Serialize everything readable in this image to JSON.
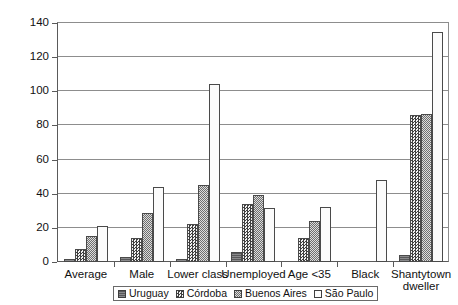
{
  "chart_data": {
    "type": "bar",
    "title": "",
    "xlabel": "",
    "ylabel": "",
    "ylim": [
      0,
      140
    ],
    "yticks": [
      0,
      20,
      40,
      60,
      80,
      100,
      120,
      140
    ],
    "grid": true,
    "legend_position": "bottom",
    "categories": [
      "Average",
      "Male",
      "Lower class",
      "Unemployed",
      "Age <35",
      "Black",
      "Shantytown dweller"
    ],
    "series": [
      {
        "name": "Uruguay",
        "pattern": "solid-dark",
        "values": [
          1.5,
          3,
          2,
          6,
          null,
          null,
          4
        ]
      },
      {
        "name": "Córdoba",
        "pattern": "checkerboard",
        "values": [
          7.5,
          14,
          22,
          34,
          14,
          null,
          86
        ]
      },
      {
        "name": "Buenos Aires",
        "pattern": "fine-crosshatch",
        "values": [
          15,
          29,
          45,
          39,
          24,
          null,
          86.5
        ]
      },
      {
        "name": "São Paulo",
        "pattern": "light-dots",
        "values": [
          21,
          44,
          104,
          31.5,
          32.5,
          48,
          135
        ]
      }
    ]
  },
  "legend": {
    "items": [
      {
        "label": "Uruguay"
      },
      {
        "label": "Córdoba"
      },
      {
        "label": "Buenos Aires"
      },
      {
        "label": "São Paulo"
      }
    ]
  },
  "colors": {
    "axis": "#5a5a5a",
    "gridline": "#8d8d8d",
    "background": "#ffffff",
    "text": "#111111"
  }
}
